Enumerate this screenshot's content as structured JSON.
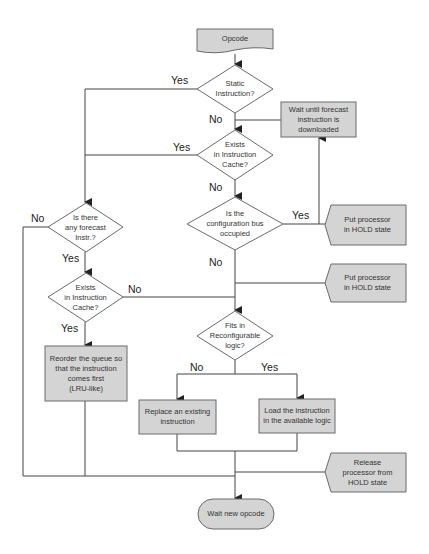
{
  "colors": {
    "fill": "#d4d4d4",
    "stroke": "#6a6a6a",
    "line": "#444444",
    "text": "#333333"
  },
  "nodes": {
    "opcode": {
      "text": "Opcode",
      "shape": "document"
    },
    "static": {
      "text": "Static\nInstruction?",
      "shape": "decision"
    },
    "wait_forecast": {
      "text": "Wait until forecast\ninstruction is\ndownloaded",
      "shape": "process"
    },
    "exists1": {
      "text": "Exists\nin Instruction\nCache?",
      "shape": "decision"
    },
    "config_bus": {
      "text": "Is the\nconfiguration bus\noccupied",
      "shape": "decision"
    },
    "hold1": {
      "text": "Put processor\nin HOLD state",
      "shape": "display"
    },
    "forecast": {
      "text": "Is there\nany forecast\nInstr.?",
      "shape": "decision"
    },
    "exists2": {
      "text": "Exists\nin Instruction\nCache?",
      "shape": "decision"
    },
    "hold2": {
      "text": "Put processor\nin HOLD state",
      "shape": "display"
    },
    "fits": {
      "text": "Fits in\nReconfigurable\nlogic?",
      "shape": "decision"
    },
    "reorder": {
      "text": "Reorder the queue so\nthat the instruction\ncomes first\n(LRU-like)",
      "shape": "process"
    },
    "replace": {
      "text": "Replace an existing\ninstruction",
      "shape": "process"
    },
    "load": {
      "text": "Load the instruction\nin the available logic",
      "shape": "process"
    },
    "release": {
      "text": "Release\nprocessor from\nHOLD state",
      "shape": "display"
    },
    "wait_new": {
      "text": "Wait new opcode",
      "shape": "terminal"
    }
  },
  "edge_labels": {
    "static_yes": "Yes",
    "static_no": "No",
    "exists1_yes": "Yes",
    "exists1_no": "No",
    "config_yes": "Yes",
    "config_no": "No",
    "forecast_no": "No",
    "forecast_yes": "Yes",
    "exists2_no": "No",
    "exists2_yes": "Yes",
    "fits_no": "No",
    "fits_yes": "Yes"
  }
}
